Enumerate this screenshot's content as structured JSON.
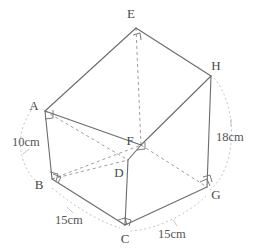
{
  "figure": {
    "kind": "geometry-solid-diagram",
    "top_fragment_text": "",
    "stroke_color": "#6b6b6b",
    "dashed_color": "#9a9a9a",
    "label_color": "#4a4a4a",
    "background": "#ffffff",
    "vertices": [
      {
        "name": "E",
        "label": "E",
        "x": 136,
        "y": 28,
        "label_x": 131,
        "label_y": 18
      },
      {
        "name": "H",
        "label": "H",
        "x": 211,
        "y": 76,
        "label_x": 214,
        "label_y": 70
      },
      {
        "name": "A",
        "label": "A",
        "x": 45,
        "y": 111,
        "label_x": 34,
        "label_y": 107
      },
      {
        "name": "F",
        "label": "F",
        "x": 141,
        "y": 145,
        "label_x": 127,
        "label_y": 142
      },
      {
        "name": "D",
        "label": "D",
        "x": 128,
        "y": 160,
        "label_x": 117,
        "label_y": 176
      },
      {
        "name": "B",
        "label": "B",
        "x": 52,
        "y": 179,
        "label_x": 36,
        "label_y": 188
      },
      {
        "name": "G",
        "label": "G",
        "x": 207,
        "y": 187,
        "label_x": 211,
        "label_y": 197
      },
      {
        "name": "C",
        "label": "C",
        "x": 125,
        "y": 225,
        "label_x": 120,
        "label_y": 241
      }
    ],
    "solid_edges": [
      {
        "name": "edge-E-A",
        "from": "E",
        "to": "A"
      },
      {
        "name": "edge-E-H",
        "from": "E",
        "to": "H"
      },
      {
        "name": "edge-A-B",
        "from": "A",
        "to": "B"
      },
      {
        "name": "edge-A-F",
        "from": "A",
        "to": "F"
      },
      {
        "name": "edge-H-G",
        "from": "H",
        "to": "G"
      },
      {
        "name": "edge-H-F",
        "from": "H",
        "to": "F"
      },
      {
        "name": "edge-F-D",
        "from": "F",
        "to": "D"
      },
      {
        "name": "edge-D-C",
        "from": "D",
        "to": "C"
      },
      {
        "name": "edge-B-C",
        "from": "B",
        "to": "C"
      },
      {
        "name": "edge-C-G",
        "from": "C",
        "to": "G"
      }
    ],
    "dashed_edges": [
      {
        "name": "edge-E-F",
        "from": "E",
        "to": "F"
      },
      {
        "name": "edge-A-D",
        "from": "A",
        "to": "D"
      },
      {
        "name": "edge-B-D",
        "from": "B",
        "to": "D"
      },
      {
        "name": "edge-B-F",
        "from": "B",
        "to": "F"
      },
      {
        "name": "edge-F-G",
        "from": "F",
        "to": "G"
      }
    ],
    "right_angle_marks": [
      {
        "name": "right-angle-E",
        "at": "E"
      },
      {
        "name": "right-angle-A",
        "at": "A"
      },
      {
        "name": "right-angle-F",
        "at": "F"
      },
      {
        "name": "right-angle-B",
        "at": "B"
      },
      {
        "name": "right-angle-C",
        "at": "C"
      },
      {
        "name": "right-angle-G",
        "at": "G"
      }
    ],
    "dimensions": [
      {
        "name": "dimension-AB",
        "text": "10cm",
        "edge": "A-B",
        "x": 12,
        "y": 145
      },
      {
        "name": "dimension-HG",
        "text": "18cm",
        "edge": "H-G",
        "x": 218,
        "y": 140
      },
      {
        "name": "dimension-BC",
        "text": "15cm",
        "edge": "B-C",
        "x": 57,
        "y": 223
      },
      {
        "name": "dimension-CG",
        "text": "15cm",
        "edge": "C-G",
        "x": 160,
        "y": 235
      }
    ],
    "dimension_arcs": [
      {
        "name": "dimension-arc-left",
        "path": "M 34 107 C 14 130, 16 168, 42 186"
      },
      {
        "name": "dimension-arc-right",
        "path": "M 214 78 C 238 106, 238 166, 210 190"
      },
      {
        "name": "dimension-arc-bottom-left",
        "path": "M 52 188 C 74 206, 96 220, 120 228"
      },
      {
        "name": "dimension-arc-bottom-right",
        "path": "M 206 196 C 186 214, 156 228, 132 230"
      }
    ],
    "leader_lines": [
      {
        "name": "leader-10cm",
        "path": "M 30 148 L 22 152"
      },
      {
        "name": "leader-18cm",
        "path": "M 231 124 L 231 116"
      },
      {
        "name": "leader-15cm-left",
        "path": "M 72 212 L 66 206"
      },
      {
        "name": "leader-15cm-right",
        "path": "M 176 224 L 172 218"
      }
    ]
  }
}
